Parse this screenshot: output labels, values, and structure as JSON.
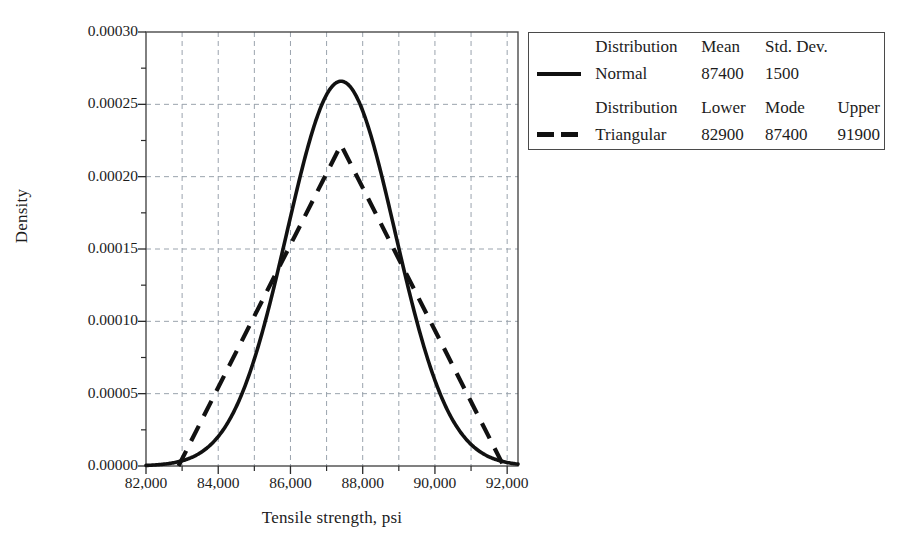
{
  "chart_data": {
    "type": "line",
    "title": "",
    "xlabel": "Tensile strength, psi",
    "ylabel": "Density",
    "xlim": [
      82000,
      92300
    ],
    "ylim": [
      0.0,
      0.0003
    ],
    "xticks": [
      "82,000",
      "84,000",
      "86,000",
      "88,000",
      "90,000",
      "92,000"
    ],
    "xtick_values": [
      82000,
      84000,
      86000,
      88000,
      90000,
      92000
    ],
    "xtick_minor_values": [
      83000,
      85000,
      87000,
      89000,
      91000
    ],
    "yticks": [
      "0.00000",
      "0.00005",
      "0.00010",
      "0.00015",
      "0.00020",
      "0.00025",
      "0.00030"
    ],
    "ytick_values": [
      0.0,
      5e-05,
      0.0001,
      0.00015,
      0.0002,
      0.00025,
      0.0003
    ],
    "grid": "dashed gridlines on both axes at every tick",
    "legend_position": "outside upper right",
    "series": [
      {
        "name": "Normal",
        "style": "solid",
        "color": "#111111",
        "mean": 87400,
        "std_dev": 1500,
        "peak_density": 0.000266,
        "points_x": [
          82000,
          82500,
          83000,
          83500,
          84000,
          84500,
          85000,
          85500,
          86000,
          86500,
          87000,
          87400,
          87500,
          88000,
          88500,
          89000,
          89500,
          90000,
          90500,
          91000,
          91500,
          92000,
          92300
        ],
        "points_y": [
          3.1e-07,
          1.3e-06,
          4.7e-06,
          1.4e-05,
          3.6e-05,
          7.6e-05,
          0.000136,
          0.0002,
          0.000244,
          0.000263,
          0.00026,
          0.000266,
          0.000263,
          0.000244,
          0.0002,
          0.000136,
          7.6e-05,
          3.6e-05,
          1.4e-05,
          4.7e-06,
          1.3e-06,
          3.1e-07,
          1e-07
        ]
      },
      {
        "name": "Triangular",
        "style": "dashed",
        "color": "#111111",
        "lower": 82900,
        "mode": 87400,
        "upper": 91900,
        "peak_density": 0.000222,
        "points_x": [
          82900,
          87400,
          91900
        ],
        "points_y": [
          0.0,
          0.000222,
          0.0
        ]
      }
    ]
  },
  "legend": {
    "block1": {
      "headers": [
        "Distribution",
        "Mean",
        "Std. Dev."
      ],
      "row": {
        "name": "Normal",
        "mean": "87400",
        "std_dev": "1500",
        "swatch": "solid-line-swatch"
      }
    },
    "block2": {
      "headers": [
        "Distribution",
        "Lower",
        "Mode",
        "Upper"
      ],
      "row": {
        "name": "Triangular",
        "lower": "82900",
        "mode": "87400",
        "upper": "91900",
        "swatch": "dashed-line-swatch"
      }
    }
  },
  "axes": {
    "ylabel": "Density",
    "xlabel": "Tensile strength, psi"
  },
  "colors": {
    "curve": "#111111",
    "grid": "#9aa3ad",
    "frame": "#4a4a4a",
    "text": "#1c1c1c",
    "background": "#ffffff"
  }
}
